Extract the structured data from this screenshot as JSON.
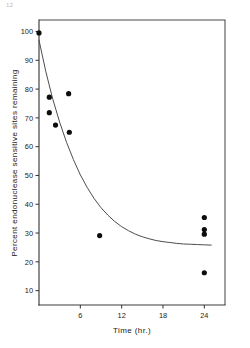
{
  "figure": {
    "corner_mark": "12",
    "background_color": "#ffffff",
    "ink_color": "#1a1a1a"
  },
  "chart_data": {
    "type": "scatter",
    "title": "",
    "subtitle": "",
    "xlabel": "Time (hr.)",
    "ylabel": "Percent endonuclease sensitive sites remaining",
    "xlim": [
      0,
      27
    ],
    "ylim": [
      5,
      104
    ],
    "xticks": [
      6,
      12,
      18,
      24
    ],
    "xtick_labels": [
      "6",
      "12",
      "18",
      "24"
    ],
    "yticks": [
      10,
      20,
      30,
      40,
      50,
      60,
      70,
      80,
      90,
      100
    ],
    "ytick_labels": [
      "10",
      "20",
      "30",
      "40",
      "50",
      "60",
      "70",
      "80",
      "90",
      "100"
    ],
    "grid": false,
    "legend": false,
    "legend_position": "none",
    "marker": "filled-circle",
    "marker_color": "#0d0d0d",
    "curve_color": "#4d4d4d",
    "series": [
      {
        "name": "Endonuclease sensitive sites",
        "type": "scatter",
        "points": [
          {
            "x": 0.0,
            "y": 99.5
          },
          {
            "x": 1.5,
            "y": 77.2
          },
          {
            "x": 1.5,
            "y": 71.8
          },
          {
            "x": 2.4,
            "y": 67.5
          },
          {
            "x": 4.3,
            "y": 78.4
          },
          {
            "x": 4.4,
            "y": 65.0
          },
          {
            "x": 8.8,
            "y": 29.1
          },
          {
            "x": 24.0,
            "y": 35.4
          },
          {
            "x": 24.0,
            "y": 31.2
          },
          {
            "x": 24.0,
            "y": 29.6
          },
          {
            "x": 24.0,
            "y": 16.2
          }
        ]
      },
      {
        "name": "Fitted decay curve",
        "type": "line",
        "description": "exponential decay approaching a plateau near 26 percent",
        "points": [
          {
            "x": 0.0,
            "y": 97.0
          },
          {
            "x": 1.0,
            "y": 86.0
          },
          {
            "x": 2.0,
            "y": 76.5
          },
          {
            "x": 3.0,
            "y": 68.5
          },
          {
            "x": 4.0,
            "y": 61.5
          },
          {
            "x": 5.0,
            "y": 55.5
          },
          {
            "x": 6.0,
            "y": 50.2
          },
          {
            "x": 7.0,
            "y": 45.8
          },
          {
            "x": 8.0,
            "y": 42.0
          },
          {
            "x": 9.0,
            "y": 38.8
          },
          {
            "x": 10.0,
            "y": 36.2
          },
          {
            "x": 11.0,
            "y": 34.0
          },
          {
            "x": 12.0,
            "y": 32.2
          },
          {
            "x": 13.0,
            "y": 30.8
          },
          {
            "x": 14.0,
            "y": 29.6
          },
          {
            "x": 15.0,
            "y": 28.7
          },
          {
            "x": 16.0,
            "y": 28.0
          },
          {
            "x": 17.0,
            "y": 27.4
          },
          {
            "x": 18.0,
            "y": 27.0
          },
          {
            "x": 19.0,
            "y": 26.7
          },
          {
            "x": 20.0,
            "y": 26.4
          },
          {
            "x": 21.0,
            "y": 26.2
          },
          {
            "x": 22.0,
            "y": 26.1
          },
          {
            "x": 23.0,
            "y": 26.0
          },
          {
            "x": 24.0,
            "y": 25.9
          },
          {
            "x": 25.0,
            "y": 25.8
          }
        ]
      }
    ]
  }
}
